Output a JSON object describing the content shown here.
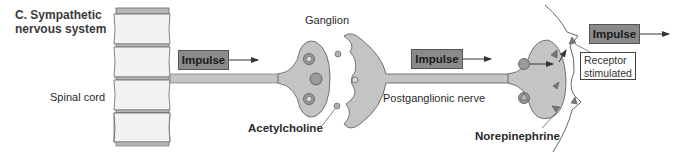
{
  "title": {
    "line1": "C. Sympathetic",
    "line2": "nervous system"
  },
  "labels": {
    "spinal_cord": "Spinal cord",
    "ganglion": "Ganglion",
    "acetylcholine": "Acetylcholine",
    "postganglionic_nerve": "Postganglionic nerve",
    "norepinephrine": "Norepinephrine",
    "receptor_line1": "Receptor",
    "receptor_line2": "stimulated"
  },
  "impulses": [
    {
      "label": "Impulse"
    },
    {
      "label": "Impulse"
    },
    {
      "label": "Impulse"
    }
  ],
  "colors": {
    "nerve_fill": "#c4c4c4",
    "impulse_fill": "#8a8a8a",
    "vertebra_fill": "#f2f2f2",
    "disc_fill": "#b8b8b8",
    "vesicle_fill": "#9a9a9a",
    "outline": "#555555"
  }
}
